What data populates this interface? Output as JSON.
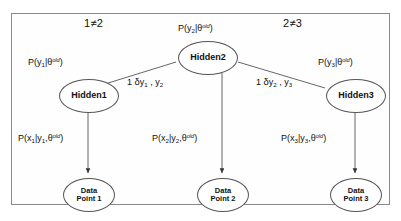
{
  "figure": {
    "kind": "probabilistic-graphical-model",
    "border_color": "#8a8a8a",
    "node_color": "#555555",
    "background": "#ffffff",
    "text_color": "#111111"
  },
  "top_labels": {
    "left_inequality": "1≠2",
    "right_inequality": "2≠3"
  },
  "nodes": {
    "hidden1": {
      "label": "Hidden1"
    },
    "hidden2": {
      "label": "Hidden2"
    },
    "hidden3": {
      "label": "Hidden3"
    },
    "data1": {
      "line1": "Data",
      "line2": "Point 1"
    },
    "data2": {
      "line1": "Data",
      "line2": "Point 2"
    },
    "data3": {
      "line1": "Data",
      "line2": "Point 3"
    }
  },
  "prior_labels": {
    "hidden1_prior": "P(y₁|θᵒᵈ)",
    "hidden2_prior": "P(y₂|θᵒᵈ)",
    "hidden3_prior": "P(y₃|θᵒᵈ)"
  },
  "edge_labels": {
    "left_potential": "1 δy₁ , y₂",
    "right_potential": "1 δy₂ , y₃"
  },
  "emission_labels": {
    "data1_emission": "P(x₁|y₁,θᵒᵈ)",
    "data2_emission": "P(x₂|y₂,θᵒᵈ)",
    "data3_emission": "P(x₃|y₃,θᵒᵈ)"
  }
}
